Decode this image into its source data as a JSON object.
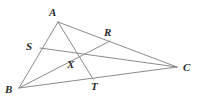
{
  "figure": {
    "type": "geometry-diagram",
    "background_color": "#ffffff",
    "line_color": "#8c8c8c",
    "label_color": "#2b2b2b",
    "line_width": 1,
    "points": [
      {
        "id": "A",
        "label": "A",
        "x": 58,
        "y": 22,
        "label_x": 49,
        "label_y": 7
      },
      {
        "id": "R",
        "label": "R",
        "x": 110,
        "y": 41,
        "label_x": 104,
        "label_y": 27
      },
      {
        "id": "C",
        "label": "C",
        "x": 177,
        "y": 67,
        "label_x": 183,
        "label_y": 62
      },
      {
        "id": "S",
        "label": "S",
        "x": 40,
        "y": 48,
        "label_x": 26,
        "label_y": 41
      },
      {
        "id": "X",
        "label": "X",
        "x": 72,
        "y": 58,
        "label_x": 67,
        "label_y": 59
      },
      {
        "id": "T",
        "label": "T",
        "x": 93,
        "y": 79,
        "label_x": 91,
        "label_y": 81
      },
      {
        "id": "B",
        "label": "B",
        "x": 19,
        "y": 88,
        "label_x": 5,
        "label_y": 84
      }
    ],
    "segments": [
      {
        "id": "AB",
        "from": "A",
        "to": "B",
        "name": "side-ab"
      },
      {
        "id": "BC",
        "from": "B",
        "to": "C",
        "name": "side-bc"
      },
      {
        "id": "AC",
        "from": "A",
        "to": "C",
        "name": "side-ac"
      },
      {
        "id": "AT",
        "from": "A",
        "to": "T",
        "name": "cevian-at"
      },
      {
        "id": "BR",
        "from": "B",
        "to": "R",
        "name": "cevian-br"
      },
      {
        "id": "SC",
        "from": "S",
        "to": "C",
        "name": "cevian-sc"
      }
    ]
  }
}
